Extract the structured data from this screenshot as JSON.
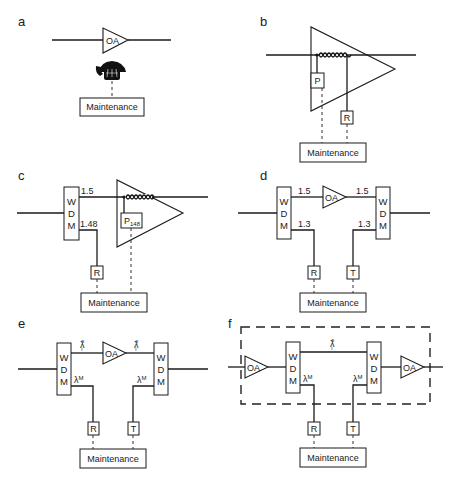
{
  "figure": {
    "panels": [
      {
        "id": "a",
        "label": "a",
        "amplifier_label": "OA",
        "link_device": "telephone",
        "maintenance_label": "Maintenance"
      },
      {
        "id": "b",
        "label": "b",
        "pump_label": "P",
        "receiver_label": "R",
        "maintenance_label": "Maintenance"
      },
      {
        "id": "c",
        "label": "c",
        "wdm_letters": [
          "W",
          "D",
          "M"
        ],
        "signal_wavelength": "1.5",
        "supervisory_wavelength": "1.48",
        "pump_label": "P",
        "pump_subscript": "148",
        "receiver_label": "R",
        "maintenance_label": "Maintenance"
      },
      {
        "id": "d",
        "label": "d",
        "wdm_letters": [
          "W",
          "D",
          "M"
        ],
        "amplifier_label": "OA",
        "signal_wavelength_in": "1.5",
        "signal_wavelength_out": "1.5",
        "supervisory_wavelength_rx": "1.3",
        "supervisory_wavelength_tx": "1.3",
        "receiver_label": "R",
        "transmitter_label": "T",
        "maintenance_label": "Maintenance"
      },
      {
        "id": "e",
        "label": "e",
        "wdm_letters": [
          "W",
          "D",
          "M"
        ],
        "amplifier_label": "OA",
        "signal_lambda": "λ",
        "signal_sup": "s",
        "signal_sub": "i",
        "supervisory_lambda": "λ",
        "supervisory_sup": "M",
        "receiver_label": "R",
        "transmitter_label": "T",
        "maintenance_label": "Maintenance"
      },
      {
        "id": "f",
        "label": "f",
        "wdm_letters": [
          "W",
          "D",
          "M"
        ],
        "amplifier_in_label": "OA",
        "amplifier_out_label": "OA",
        "signal_lambda": "λ",
        "signal_sup": "s",
        "signal_sub": "i",
        "supervisory_lambda": "λ",
        "supervisory_sup": "M",
        "receiver_label": "R",
        "transmitter_label": "T",
        "maintenance_label": "Maintenance"
      }
    ]
  }
}
